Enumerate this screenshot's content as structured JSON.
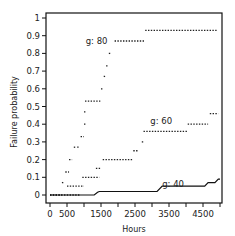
{
  "chart_data": {
    "type": "line",
    "title": "",
    "xlabel": "Hours",
    "ylabel": "Failure probability",
    "xlim": [
      0,
      5000
    ],
    "ylim": [
      0,
      1
    ],
    "x_ticks": [
      0,
      500,
      1000,
      1500,
      2000,
      2500,
      3000,
      3500,
      4000,
      4500,
      5000
    ],
    "x_tick_labels": [
      "0",
      "500",
      "1500",
      "2500",
      "3500",
      "4500"
    ],
    "x_tick_label_values": [
      0,
      500,
      1500,
      2500,
      3500,
      4500
    ],
    "y_ticks": [
      0,
      0.1,
      0.2,
      0.3,
      0.4,
      0.5,
      0.6,
      0.7,
      0.8,
      0.9,
      1
    ],
    "y_tick_labels": [
      "0",
      "0.1",
      "0.2",
      "0.3",
      "0.4",
      "0.5",
      "0.6",
      "0.7",
      "0.8",
      "0.9",
      "1"
    ],
    "grid": false,
    "legend": "inline labels",
    "series": [
      {
        "name": "g: 80",
        "style": "dotted-steps",
        "label_pos": [
          1050,
          0.87
        ],
        "segments": [
          {
            "x0": 0,
            "x1": 350,
            "y": 0.0
          },
          {
            "x0": 350,
            "x1": 420,
            "y": 0.07
          },
          {
            "x0": 450,
            "x1": 560,
            "y": 0.13
          },
          {
            "x0": 560,
            "x1": 650,
            "y": 0.2
          },
          {
            "x0": 700,
            "x1": 750,
            "y": 0.27
          },
          {
            "x0": 800,
            "x1": 870,
            "y": 0.27
          },
          {
            "x0": 900,
            "x1": 1000,
            "y": 0.33
          },
          {
            "x0": 1000,
            "x1": 1010,
            "y": 0.4
          },
          {
            "x0": 1000,
            "x1": 1010,
            "y": 0.47
          },
          {
            "x0": 1030,
            "x1": 1480,
            "y": 0.53
          },
          {
            "x0": 1500,
            "x1": 1520,
            "y": 0.6
          },
          {
            "x0": 1580,
            "x1": 1620,
            "y": 0.67
          },
          {
            "x0": 1650,
            "x1": 1700,
            "y": 0.73
          },
          {
            "x0": 1730,
            "x1": 1750,
            "y": 0.8
          },
          {
            "x0": 1900,
            "x1": 2800,
            "y": 0.87
          },
          {
            "x0": 2800,
            "x1": 4900,
            "y": 0.93
          }
        ]
      },
      {
        "name": "g: 60",
        "style": "dotted-steps",
        "label_pos": [
          2950,
          0.42
        ],
        "segments": [
          {
            "x0": 0,
            "x1": 900,
            "y": 0.0
          },
          {
            "x0": 500,
            "x1": 1000,
            "y": 0.05
          },
          {
            "x0": 950,
            "x1": 1450,
            "y": 0.1
          },
          {
            "x0": 1350,
            "x1": 1500,
            "y": 0.15
          },
          {
            "x0": 1550,
            "x1": 2450,
            "y": 0.2
          },
          {
            "x0": 2450,
            "x1": 2600,
            "y": 0.25
          },
          {
            "x0": 2700,
            "x1": 2730,
            "y": 0.3
          },
          {
            "x0": 2750,
            "x1": 4050,
            "y": 0.36
          },
          {
            "x0": 4050,
            "x1": 4650,
            "y": 0.4
          },
          {
            "x0": 4700,
            "x1": 4950,
            "y": 0.46
          }
        ]
      },
      {
        "name": "g: 40",
        "style": "solid-line",
        "label_pos": [
          3300,
          0.06
        ],
        "points": [
          [
            0,
            0.0
          ],
          [
            1300,
            0.0
          ],
          [
            1400,
            0.015
          ],
          [
            1450,
            0.02
          ],
          [
            3150,
            0.02
          ],
          [
            3300,
            0.05
          ],
          [
            4550,
            0.05
          ],
          [
            4650,
            0.07
          ],
          [
            4850,
            0.07
          ],
          [
            4950,
            0.09
          ],
          [
            5000,
            0.09
          ]
        ]
      }
    ]
  }
}
